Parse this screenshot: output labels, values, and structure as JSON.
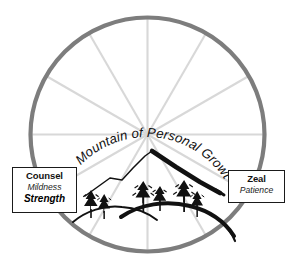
{
  "diagram": {
    "name": "wheel-of-personal-growth",
    "title_curved": "Mountain of  Personal Growth",
    "rim_color": "#7d7d7d",
    "spoke_color": "#d5d5d5",
    "mountain_color": "#111111",
    "background": "#ffffff",
    "spoke_count": 12
  },
  "labels": {
    "left": {
      "name": "counsel-box",
      "line1": "Counsel",
      "line2": "Mildness",
      "line3": "Strength"
    },
    "right": {
      "name": "zeal-box",
      "line1": "Zeal",
      "line2": "Patience"
    }
  },
  "scene": {
    "mountain_peak_label": "mountain-peak",
    "tree_group_left": "left-tree-cluster",
    "tree_group_right": "right-tree-cluster",
    "hill_left": "left-hill-ridge",
    "hill_right": "right-hill-ridge"
  }
}
